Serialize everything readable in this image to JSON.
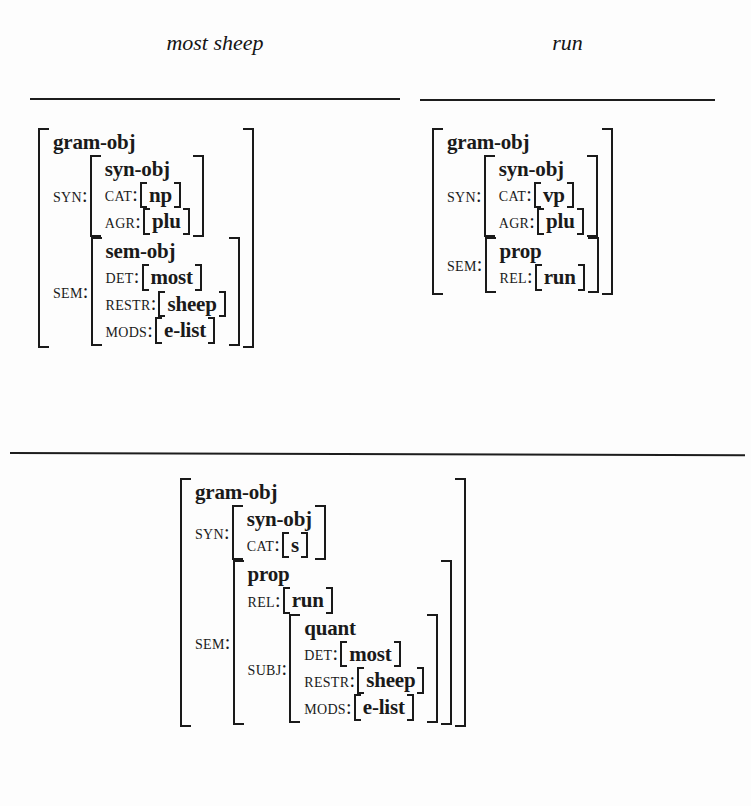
{
  "figure": {
    "type": "attribute-value-matrix-diagram",
    "headers": [
      {
        "id": "most-sheep",
        "text": "most sheep"
      },
      {
        "id": "run",
        "text": "run"
      }
    ],
    "rules": [
      "rule-left",
      "rule-right",
      "rule-middle"
    ],
    "colors": {
      "ink": "#1a1a1a",
      "paper": "#fdfdfd"
    }
  },
  "avm_most_sheep": {
    "type": "gram-obj",
    "features": {
      "syn": {
        "attr": "SYN",
        "type": "syn-obj",
        "cat": {
          "attr": "CAT",
          "value": "np"
        },
        "agr": {
          "attr": "AGR",
          "value": "plu"
        }
      },
      "sem": {
        "attr": "SEM",
        "type": "sem-obj",
        "det": {
          "attr": "DET",
          "value": "most"
        },
        "restr": {
          "attr": "RESTR",
          "value": "sheep"
        },
        "mods": {
          "attr": "MODS",
          "value": "e-list"
        }
      }
    }
  },
  "avm_run": {
    "type": "gram-obj",
    "features": {
      "syn": {
        "attr": "SYN",
        "type": "syn-obj",
        "cat": {
          "attr": "CAT",
          "value": "vp"
        },
        "agr": {
          "attr": "AGR",
          "value": "plu"
        }
      },
      "sem": {
        "attr": "SEM",
        "type": "prop",
        "rel": {
          "attr": "REL",
          "value": "run"
        }
      }
    }
  },
  "avm_sentence": {
    "type": "gram-obj",
    "features": {
      "syn": {
        "attr": "SYN",
        "type": "syn-obj",
        "cat": {
          "attr": "CAT",
          "value": "s"
        }
      },
      "sem": {
        "attr": "SEM",
        "type": "prop",
        "rel": {
          "attr": "REL",
          "value": "run"
        },
        "subj": {
          "attr": "SUBJ",
          "type": "quant",
          "det": {
            "attr": "DET",
            "value": "most"
          },
          "restr": {
            "attr": "RESTR",
            "value": "sheep"
          },
          "mods": {
            "attr": "MODS",
            "value": "e-list"
          }
        }
      }
    }
  }
}
